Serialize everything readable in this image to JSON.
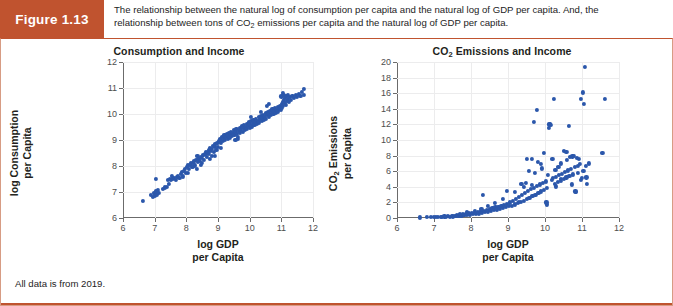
{
  "figure": {
    "tag": "Figure 1.13",
    "caption_line1": "The relationship between the natural log of consumption per capita and the natural log of GDP per capita. And, the",
    "caption_line2_a": "relationship between tons of CO",
    "caption_line2_sub": "2",
    "caption_line2_b": " emissions per capita and the natural log of GDP per capita.",
    "footnote": "All data is from 2019.",
    "header_color": "#c0532f",
    "border_color": "#d79c84",
    "marker_color": "#2b57ab"
  },
  "chart_data": [
    {
      "type": "scatter",
      "title": "Consumption and Income",
      "xlabel_line1": "log GDP",
      "xlabel_line2": "per Capita",
      "ylabel_line1": "log Consumption",
      "ylabel_line2": "per Capita",
      "xlim": [
        6,
        12
      ],
      "ylim": [
        6,
        12
      ],
      "xticks": [
        6,
        7,
        8,
        9,
        10,
        11,
        12
      ],
      "yticks": [
        6,
        7,
        8,
        9,
        10,
        11,
        12
      ],
      "grid": true,
      "legend": "none",
      "points": [
        [
          6.62,
          6.66
        ],
        [
          6.88,
          6.88
        ],
        [
          6.95,
          6.82
        ],
        [
          6.98,
          6.95
        ],
        [
          7.02,
          6.87
        ],
        [
          7.05,
          7.02
        ],
        [
          7.08,
          6.9
        ],
        [
          7.1,
          7.07
        ],
        [
          7.12,
          6.98
        ],
        [
          7.05,
          7.5
        ],
        [
          7.25,
          7.12
        ],
        [
          7.32,
          7.18
        ],
        [
          7.38,
          7.2
        ],
        [
          7.42,
          7.45
        ],
        [
          7.48,
          7.5
        ],
        [
          7.52,
          7.47
        ],
        [
          7.58,
          7.52
        ],
        [
          7.62,
          7.55
        ],
        [
          7.66,
          7.48
        ],
        [
          7.7,
          7.58
        ],
        [
          7.74,
          7.62
        ],
        [
          7.78,
          7.55
        ],
        [
          7.82,
          7.7
        ],
        [
          7.86,
          7.78
        ],
        [
          7.88,
          7.6
        ],
        [
          7.92,
          7.82
        ],
        [
          7.95,
          7.88
        ],
        [
          7.98,
          7.75
        ],
        [
          8.02,
          7.95
        ],
        [
          8.05,
          8.02
        ],
        [
          8.08,
          7.88
        ],
        [
          8.12,
          8.05
        ],
        [
          8.15,
          8.1
        ],
        [
          8.18,
          7.95
        ],
        [
          8.22,
          8.12
        ],
        [
          8.25,
          8.18
        ],
        [
          8.28,
          8.02
        ],
        [
          8.3,
          8.22
        ],
        [
          8.33,
          7.9
        ],
        [
          8.36,
          8.15
        ],
        [
          8.38,
          8.28
        ],
        [
          8.42,
          8.2
        ],
        [
          8.45,
          8.35
        ],
        [
          8.48,
          8.12
        ],
        [
          8.5,
          8.3
        ],
        [
          8.54,
          8.42
        ],
        [
          8.56,
          8.25
        ],
        [
          8.6,
          8.48
        ],
        [
          8.62,
          8.55
        ],
        [
          8.65,
          8.35
        ],
        [
          8.68,
          8.52
        ],
        [
          8.7,
          8.62
        ],
        [
          8.72,
          8.45
        ],
        [
          8.75,
          8.7
        ],
        [
          8.78,
          8.58
        ],
        [
          8.8,
          8.4
        ],
        [
          8.82,
          8.65
        ],
        [
          8.85,
          8.78
        ],
        [
          8.88,
          8.55
        ],
        [
          8.9,
          8.72
        ],
        [
          8.92,
          8.85
        ],
        [
          8.95,
          8.62
        ],
        [
          8.98,
          8.9
        ],
        [
          9.0,
          8.75
        ],
        [
          9.02,
          8.95
        ],
        [
          9.05,
          9.05
        ],
        [
          9.08,
          8.88
        ],
        [
          9.1,
          9.0
        ],
        [
          9.12,
          9.12
        ],
        [
          9.15,
          8.95
        ],
        [
          9.18,
          9.08
        ],
        [
          9.2,
          9.18
        ],
        [
          9.22,
          9.0
        ],
        [
          9.25,
          9.12
        ],
        [
          9.28,
          9.22
        ],
        [
          9.3,
          9.05
        ],
        [
          9.32,
          9.18
        ],
        [
          9.35,
          9.28
        ],
        [
          9.38,
          9.1
        ],
        [
          9.4,
          9.22
        ],
        [
          9.42,
          9.32
        ],
        [
          9.45,
          9.15
        ],
        [
          9.48,
          9.28
        ],
        [
          9.5,
          9.38
        ],
        [
          9.52,
          9.2
        ],
        [
          9.55,
          9.32
        ],
        [
          9.58,
          9.42
        ],
        [
          9.6,
          9.25
        ],
        [
          9.62,
          9.05
        ],
        [
          9.65,
          9.35
        ],
        [
          9.68,
          9.45
        ],
        [
          9.7,
          9.28
        ],
        [
          9.72,
          9.4
        ],
        [
          9.75,
          9.52
        ],
        [
          9.78,
          9.32
        ],
        [
          9.8,
          9.45
        ],
        [
          9.82,
          9.58
        ],
        [
          9.85,
          9.38
        ],
        [
          9.88,
          9.5
        ],
        [
          9.9,
          9.62
        ],
        [
          9.92,
          9.42
        ],
        [
          9.95,
          9.55
        ],
        [
          9.98,
          9.68
        ],
        [
          10.0,
          9.48
        ],
        [
          10.02,
          9.6
        ],
        [
          10.05,
          9.72
        ],
        [
          10.08,
          9.52
        ],
        [
          10.1,
          9.65
        ],
        [
          10.12,
          9.78
        ],
        [
          10.15,
          9.58
        ],
        [
          10.18,
          9.7
        ],
        [
          10.2,
          9.82
        ],
        [
          10.22,
          9.62
        ],
        [
          10.25,
          9.75
        ],
        [
          10.28,
          9.88
        ],
        [
          10.3,
          9.68
        ],
        [
          10.32,
          9.8
        ],
        [
          10.35,
          9.92
        ],
        [
          10.38,
          9.72
        ],
        [
          10.4,
          9.85
        ],
        [
          10.42,
          9.98
        ],
        [
          10.45,
          9.78
        ],
        [
          10.48,
          9.9
        ],
        [
          10.5,
          10.02
        ],
        [
          10.52,
          9.82
        ],
        [
          10.55,
          9.95
        ],
        [
          10.58,
          10.08
        ],
        [
          10.6,
          9.88
        ],
        [
          10.62,
          10.0
        ],
        [
          10.65,
          10.12
        ],
        [
          10.68,
          9.95
        ],
        [
          10.7,
          10.05
        ],
        [
          10.72,
          10.18
        ],
        [
          10.75,
          10.0
        ],
        [
          10.78,
          10.1
        ],
        [
          10.8,
          10.22
        ],
        [
          10.82,
          10.05
        ],
        [
          10.85,
          10.15
        ],
        [
          10.88,
          10.28
        ],
        [
          10.9,
          10.1
        ],
        [
          10.92,
          10.2
        ],
        [
          10.95,
          10.32
        ],
        [
          10.98,
          10.15
        ],
        [
          11.0,
          10.25
        ],
        [
          11.02,
          10.38
        ],
        [
          11.04,
          10.45
        ],
        [
          11.06,
          10.3
        ],
        [
          11.08,
          10.55
        ],
        [
          11.1,
          10.42
        ],
        [
          11.12,
          10.62
        ],
        [
          11.14,
          10.35
        ],
        [
          11.16,
          10.7
        ],
        [
          11.18,
          10.5
        ],
        [
          11.2,
          10.75
        ],
        [
          11.22,
          10.58
        ],
        [
          11.25,
          10.45
        ],
        [
          11.28,
          10.65
        ],
        [
          11.3,
          10.55
        ],
        [
          11.35,
          10.7
        ],
        [
          11.4,
          10.62
        ],
        [
          11.45,
          10.72
        ],
        [
          11.5,
          10.66
        ],
        [
          11.55,
          10.78
        ],
        [
          11.6,
          10.7
        ],
        [
          11.65,
          10.85
        ],
        [
          11.7,
          10.72
        ],
        [
          11.72,
          10.98
        ],
        [
          11.05,
          10.8
        ],
        [
          11.08,
          10.72
        ],
        [
          10.55,
          10.3
        ],
        [
          10.62,
          10.4
        ],
        [
          9.55,
          9.0
        ],
        [
          9.62,
          9.12
        ],
        [
          8.75,
          8.28
        ],
        [
          8.35,
          8.4
        ],
        [
          8.9,
          8.38
        ],
        [
          9.08,
          8.7
        ],
        [
          10.05,
          9.9
        ],
        [
          10.35,
          10.08
        ],
        [
          11.0,
          10.68
        ],
        [
          7.45,
          7.32
        ],
        [
          7.55,
          7.62
        ],
        [
          8.05,
          7.72
        ],
        [
          8.2,
          7.98
        ],
        [
          8.45,
          8.05
        ]
      ]
    },
    {
      "type": "scatter",
      "title_a": "CO",
      "title_sub": "2",
      "title_b": " Emissions and Income",
      "xlabel_line1": "log GDP",
      "xlabel_line2": "per Capita",
      "ylabel_line1_a": "CO",
      "ylabel_line1_sub": "2",
      "ylabel_line1_b": " Emissions",
      "ylabel_line2": "per Capita",
      "xlim": [
        6,
        12
      ],
      "ylim": [
        0,
        20
      ],
      "xticks": [
        6,
        7,
        8,
        9,
        10,
        11,
        12
      ],
      "yticks": [
        0,
        2,
        4,
        6,
        8,
        10,
        12,
        14,
        16,
        18,
        20
      ],
      "grid": true,
      "legend": "none",
      "points": [
        [
          6.62,
          0.08
        ],
        [
          6.8,
          0.1
        ],
        [
          6.92,
          0.12
        ],
        [
          7.0,
          0.1
        ],
        [
          7.05,
          0.15
        ],
        [
          7.1,
          0.12
        ],
        [
          7.18,
          0.18
        ],
        [
          7.22,
          0.14
        ],
        [
          7.28,
          0.2
        ],
        [
          7.32,
          0.16
        ],
        [
          7.38,
          0.22
        ],
        [
          7.42,
          0.18
        ],
        [
          7.48,
          0.25
        ],
        [
          7.52,
          0.2
        ],
        [
          7.58,
          0.28
        ],
        [
          7.62,
          0.35
        ],
        [
          7.66,
          0.25
        ],
        [
          7.7,
          0.4
        ],
        [
          7.74,
          0.3
        ],
        [
          7.78,
          0.45
        ],
        [
          7.82,
          0.35
        ],
        [
          7.86,
          0.5
        ],
        [
          7.9,
          0.4
        ],
        [
          7.94,
          0.6
        ],
        [
          7.98,
          0.45
        ],
        [
          8.02,
          0.65
        ],
        [
          8.06,
          0.5
        ],
        [
          8.1,
          0.7
        ],
        [
          8.14,
          0.55
        ],
        [
          8.18,
          0.8
        ],
        [
          8.22,
          0.6
        ],
        [
          8.26,
          0.85
        ],
        [
          8.3,
          0.7
        ],
        [
          8.34,
          0.95
        ],
        [
          8.32,
          3.0
        ],
        [
          8.38,
          0.75
        ],
        [
          8.42,
          1.05
        ],
        [
          8.46,
          0.85
        ],
        [
          8.5,
          1.15
        ],
        [
          8.54,
          0.95
        ],
        [
          8.58,
          1.25
        ],
        [
          8.62,
          1.0
        ],
        [
          8.66,
          1.35
        ],
        [
          8.7,
          1.1
        ],
        [
          8.74,
          1.45
        ],
        [
          8.78,
          1.2
        ],
        [
          8.82,
          1.55
        ],
        [
          8.86,
          1.3
        ],
        [
          8.9,
          1.7
        ],
        [
          8.94,
          1.4
        ],
        [
          8.96,
          3.45
        ],
        [
          8.98,
          1.85
        ],
        [
          9.02,
          1.5
        ],
        [
          9.06,
          2.0
        ],
        [
          9.1,
          1.6
        ],
        [
          9.14,
          2.2
        ],
        [
          9.18,
          1.75
        ],
        [
          9.22,
          2.45
        ],
        [
          9.26,
          1.9
        ],
        [
          9.3,
          2.7
        ],
        [
          9.34,
          2.05
        ],
        [
          9.36,
          4.35
        ],
        [
          9.38,
          2.95
        ],
        [
          9.42,
          2.2
        ],
        [
          9.46,
          3.2
        ],
        [
          9.48,
          4.55
        ],
        [
          9.5,
          2.4
        ],
        [
          9.54,
          3.45
        ],
        [
          9.56,
          6.0
        ],
        [
          9.58,
          2.6
        ],
        [
          9.62,
          3.7
        ],
        [
          9.64,
          7.6
        ],
        [
          9.66,
          2.8
        ],
        [
          9.7,
          3.9
        ],
        [
          9.7,
          12.3
        ],
        [
          9.72,
          5.8
        ],
        [
          9.74,
          3.0
        ],
        [
          9.78,
          4.1
        ],
        [
          9.78,
          13.85
        ],
        [
          9.8,
          7.2
        ],
        [
          9.82,
          3.2
        ],
        [
          9.86,
          4.3
        ],
        [
          9.88,
          6.9
        ],
        [
          9.9,
          3.4
        ],
        [
          9.94,
          4.5
        ],
        [
          9.96,
          8.35
        ],
        [
          9.98,
          3.6
        ],
        [
          10.02,
          4.7
        ],
        [
          10.04,
          2.0
        ],
        [
          10.06,
          1.75
        ],
        [
          10.08,
          5.5
        ],
        [
          10.1,
          11.6
        ],
        [
          10.12,
          12.0
        ],
        [
          10.14,
          12.1
        ],
        [
          10.16,
          11.95
        ],
        [
          10.18,
          4.9
        ],
        [
          10.2,
          7.55
        ],
        [
          10.22,
          5.1
        ],
        [
          10.24,
          15.25
        ],
        [
          10.26,
          4.4
        ],
        [
          10.28,
          6.2
        ],
        [
          10.3,
          5.3
        ],
        [
          10.34,
          4.6
        ],
        [
          10.36,
          6.6
        ],
        [
          10.38,
          5.5
        ],
        [
          10.42,
          4.8
        ],
        [
          10.44,
          7.0
        ],
        [
          10.46,
          5.7
        ],
        [
          10.5,
          5.0
        ],
        [
          10.52,
          8.6
        ],
        [
          10.54,
          5.9
        ],
        [
          10.58,
          5.2
        ],
        [
          10.6,
          7.4
        ],
        [
          10.62,
          6.1
        ],
        [
          10.64,
          11.8
        ],
        [
          10.66,
          5.4
        ],
        [
          10.68,
          7.8
        ],
        [
          10.7,
          6.3
        ],
        [
          10.72,
          4.3
        ],
        [
          10.74,
          7.9
        ],
        [
          10.76,
          5.6
        ],
        [
          10.78,
          8.0
        ],
        [
          10.8,
          6.5
        ],
        [
          10.82,
          3.4
        ],
        [
          10.84,
          3.3
        ],
        [
          10.86,
          7.7
        ],
        [
          10.88,
          6.7
        ],
        [
          10.9,
          5.8
        ],
        [
          10.92,
          7.6
        ],
        [
          10.94,
          6.9
        ],
        [
          10.96,
          4.9
        ],
        [
          10.98,
          15.3
        ],
        [
          11.0,
          5.1
        ],
        [
          11.02,
          16.1
        ],
        [
          11.04,
          6.0
        ],
        [
          11.06,
          14.6
        ],
        [
          11.08,
          19.35
        ],
        [
          11.1,
          6.7
        ],
        [
          11.12,
          5.2
        ],
        [
          11.14,
          4.35
        ],
        [
          11.18,
          7.0
        ],
        [
          11.55,
          8.3
        ],
        [
          11.62,
          15.25
        ],
        [
          10.05,
          3.85
        ],
        [
          9.92,
          6.35
        ],
        [
          9.64,
          4.2
        ],
        [
          9.52,
          7.55
        ],
        [
          10.3,
          4.05
        ],
        [
          10.44,
          5.05
        ],
        [
          10.58,
          8.5
        ],
        [
          9.44,
          3.95
        ],
        [
          9.3,
          2.1
        ],
        [
          9.18,
          3.3
        ],
        [
          8.86,
          2.4
        ],
        [
          8.64,
          1.9
        ],
        [
          8.46,
          1.55
        ],
        [
          8.28,
          1.2
        ],
        [
          8.1,
          0.95
        ],
        [
          7.9,
          0.72
        ],
        [
          7.7,
          0.55
        ]
      ]
    }
  ]
}
